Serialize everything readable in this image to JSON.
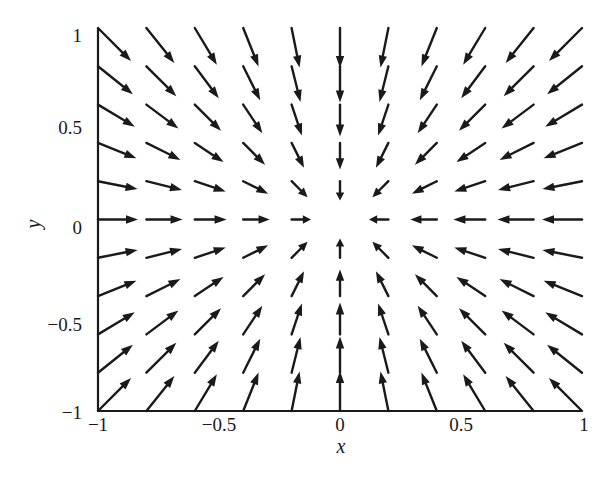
{
  "chart_data": {
    "type": "quiver",
    "title": "",
    "xlabel": "x",
    "ylabel": "y",
    "xlim": [
      -1,
      1
    ],
    "ylim": [
      -1,
      1
    ],
    "grid": false,
    "legend": null,
    "xticks": [
      -1,
      -0.5,
      0,
      0.5,
      1
    ],
    "xtick_labels": [
      "−1",
      "−0.5",
      "0",
      "0.5",
      "1"
    ],
    "yticks": [
      -1,
      -0.5,
      0,
      0.5,
      1
    ],
    "ytick_labels": [
      "−1",
      "−0.5",
      "0",
      "0.5",
      "1"
    ],
    "field_description": "Vector field pointing radially toward the origin, F(x,y) = -(x, y); arrows drawn at a 0.2-spaced grid from -1 to 1, with no arrow at the origin; arrow length grows sublinearly with distance from origin",
    "grid_points": {
      "x": [
        -1,
        -0.8,
        -0.6,
        -0.4,
        -0.2,
        0,
        0.2,
        0.4,
        0.6,
        0.8,
        1
      ],
      "y": [
        -1,
        -0.8,
        -0.6,
        -0.4,
        -0.2,
        0,
        0.2,
        0.4,
        0.6,
        0.8,
        1
      ]
    },
    "vector_formula": {
      "u": "-x",
      "v": "-y"
    },
    "arrow_length_px_at_r1": 40,
    "arrow_length_exponent": 0.45,
    "color": "#1a1a1a"
  }
}
